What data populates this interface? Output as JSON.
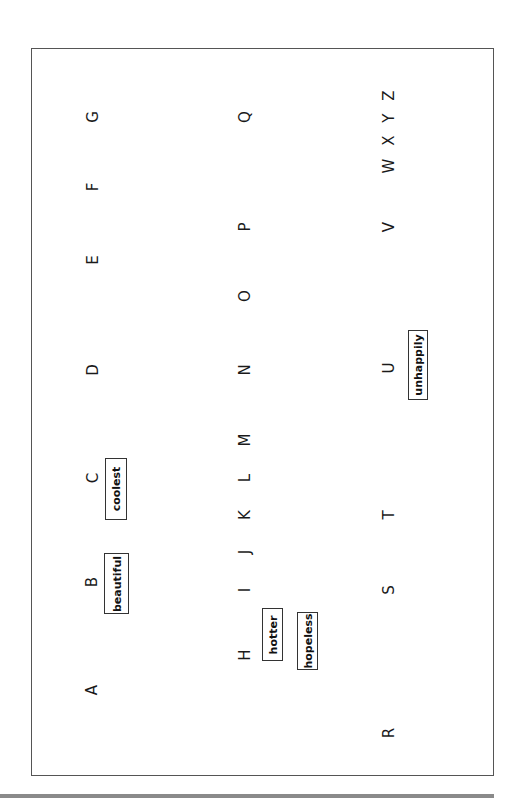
{
  "worksheet": {
    "letters": {
      "A": "A",
      "B": "B",
      "C": "C",
      "D": "D",
      "E": "E",
      "F": "F",
      "G": "G",
      "H": "H",
      "I": "I",
      "J": "J",
      "K": "K",
      "L": "L",
      "M": "M",
      "N": "N",
      "O": "O",
      "P": "P",
      "Q": "Q",
      "R": "R",
      "S": "S",
      "T": "T",
      "U": "U",
      "V": "V",
      "WXYZ": "W X Y Z"
    },
    "word_boxes": {
      "beautiful": "beautiful",
      "coolest": "coolest",
      "hotter": "hotter",
      "hopeless": "hopeless",
      "unhappily": "unhappily"
    }
  }
}
